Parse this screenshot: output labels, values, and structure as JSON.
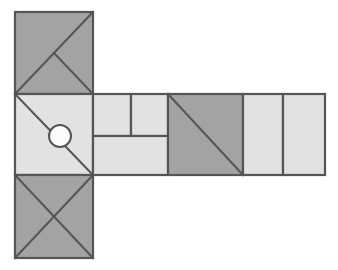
{
  "document": {
    "title": "Geometric Net Diagram",
    "background_color": "#ffffff",
    "width": 338,
    "height": 270
  },
  "palette": {
    "dark_fill": "#a3a3a3",
    "light_fill": "#e2e2e2",
    "stroke": "#555555",
    "circle_fill": "#fcfcfc",
    "background": "#ffffff"
  },
  "style": {
    "stroke_width": 2.2,
    "thin_stroke_width": 2.0
  },
  "geometry": {
    "left_column": {
      "x_left": 15,
      "x_right": 93,
      "y_top": 12,
      "y_mid_top": 94,
      "y_mid_bottom": 175,
      "y_bottom": 258
    },
    "band": {
      "y_top": 94,
      "y_bottom": 175,
      "x_start": 93,
      "x_div_1": 131,
      "x_div_2": 168,
      "x_div_3": 243,
      "x_div_4": 283,
      "x_end": 325,
      "y_inner_split": 136
    },
    "circle": {
      "cx": 60,
      "cy": 136,
      "r": 11
    }
  },
  "chart_data": {
    "type": "diagram",
    "shapes": [
      {
        "id": "top-square",
        "name": "top-left-square",
        "kind": "square",
        "fill": "dark",
        "bounds": [
          15,
          12,
          93,
          94
        ],
        "decoration": "diagonal-top-right-to-bottom-left plus half-diagonal from center to bottom-right corner"
      },
      {
        "id": "middle-square",
        "name": "middle-left-square",
        "kind": "square",
        "fill": "light",
        "bounds": [
          15,
          94,
          93,
          175
        ],
        "decoration": "diagonal-top-left-to-bottom-right with white circle at center"
      },
      {
        "id": "bottom-square",
        "name": "bottom-left-square",
        "kind": "square",
        "fill": "dark",
        "bounds": [
          15,
          175,
          93,
          258
        ],
        "decoration": "X both diagonals"
      },
      {
        "id": "band-cell-1",
        "name": "band-upper-left-rectangle",
        "kind": "rectangle",
        "fill": "light",
        "bounds": [
          93,
          94,
          131,
          136
        ],
        "decoration": "none"
      },
      {
        "id": "band-cell-2",
        "name": "band-upper-right-rectangle",
        "kind": "rectangle",
        "fill": "light",
        "bounds": [
          131,
          94,
          168,
          136
        ],
        "decoration": "none"
      },
      {
        "id": "band-cell-3",
        "name": "band-lower-rectangle",
        "kind": "rectangle",
        "fill": "light",
        "bounds": [
          93,
          136,
          168,
          175
        ],
        "decoration": "none"
      },
      {
        "id": "band-cell-4",
        "name": "band-dark-square",
        "kind": "square",
        "fill": "dark",
        "bounds": [
          168,
          94,
          243,
          175
        ],
        "decoration": "diagonal-top-left-to-bottom-right"
      },
      {
        "id": "band-cell-5",
        "name": "band-right-rectangle-1",
        "kind": "rectangle",
        "fill": "light",
        "bounds": [
          243,
          94,
          283,
          175
        ],
        "decoration": "none"
      },
      {
        "id": "band-cell-6",
        "name": "band-right-rectangle-2",
        "kind": "rectangle",
        "fill": "light",
        "bounds": [
          283,
          94,
          325,
          175
        ],
        "decoration": "none"
      }
    ],
    "annotations": [],
    "legend": [],
    "grid": false
  }
}
